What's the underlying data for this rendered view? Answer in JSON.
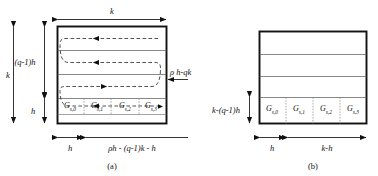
{
  "figure": {
    "type": "two-panel-geometry-diagram",
    "background_color": "#ffffff",
    "line_color": "#111111",
    "dashed_color": "#444444",
    "dotted_color": "#777777"
  },
  "panel_a": {
    "caption": "(a)",
    "top_dimension": "k",
    "left_outer_dimension": "k",
    "left_upper_dimension": "(q-1)h",
    "left_lower_dimension": "h",
    "right_dimension": "ρ h-qk",
    "bottom_left_dimension": "h",
    "bottom_right_dimension": "ρh - (q-1)k - h",
    "cells": [
      {
        "base": "G",
        "sub": "s,0"
      },
      {
        "base": "G",
        "sub": "s,1"
      },
      {
        "base": "G",
        "sub": "s,2"
      },
      {
        "base": "G",
        "sub": "s,3"
      }
    ],
    "row_count": 4,
    "serpentine_passes": 3
  },
  "panel_b": {
    "caption": "(b)",
    "left_dimension": "k-(q-1)h",
    "bottom_left_dimension": "h",
    "bottom_right_dimension": "k-h",
    "cells": [
      {
        "base": "G",
        "sub": "s,0"
      },
      {
        "base": "G",
        "sub": "s,1"
      },
      {
        "base": "G",
        "sub": "s,2"
      },
      {
        "base": "G",
        "sub": "s,3"
      }
    ],
    "row_count": 4
  }
}
